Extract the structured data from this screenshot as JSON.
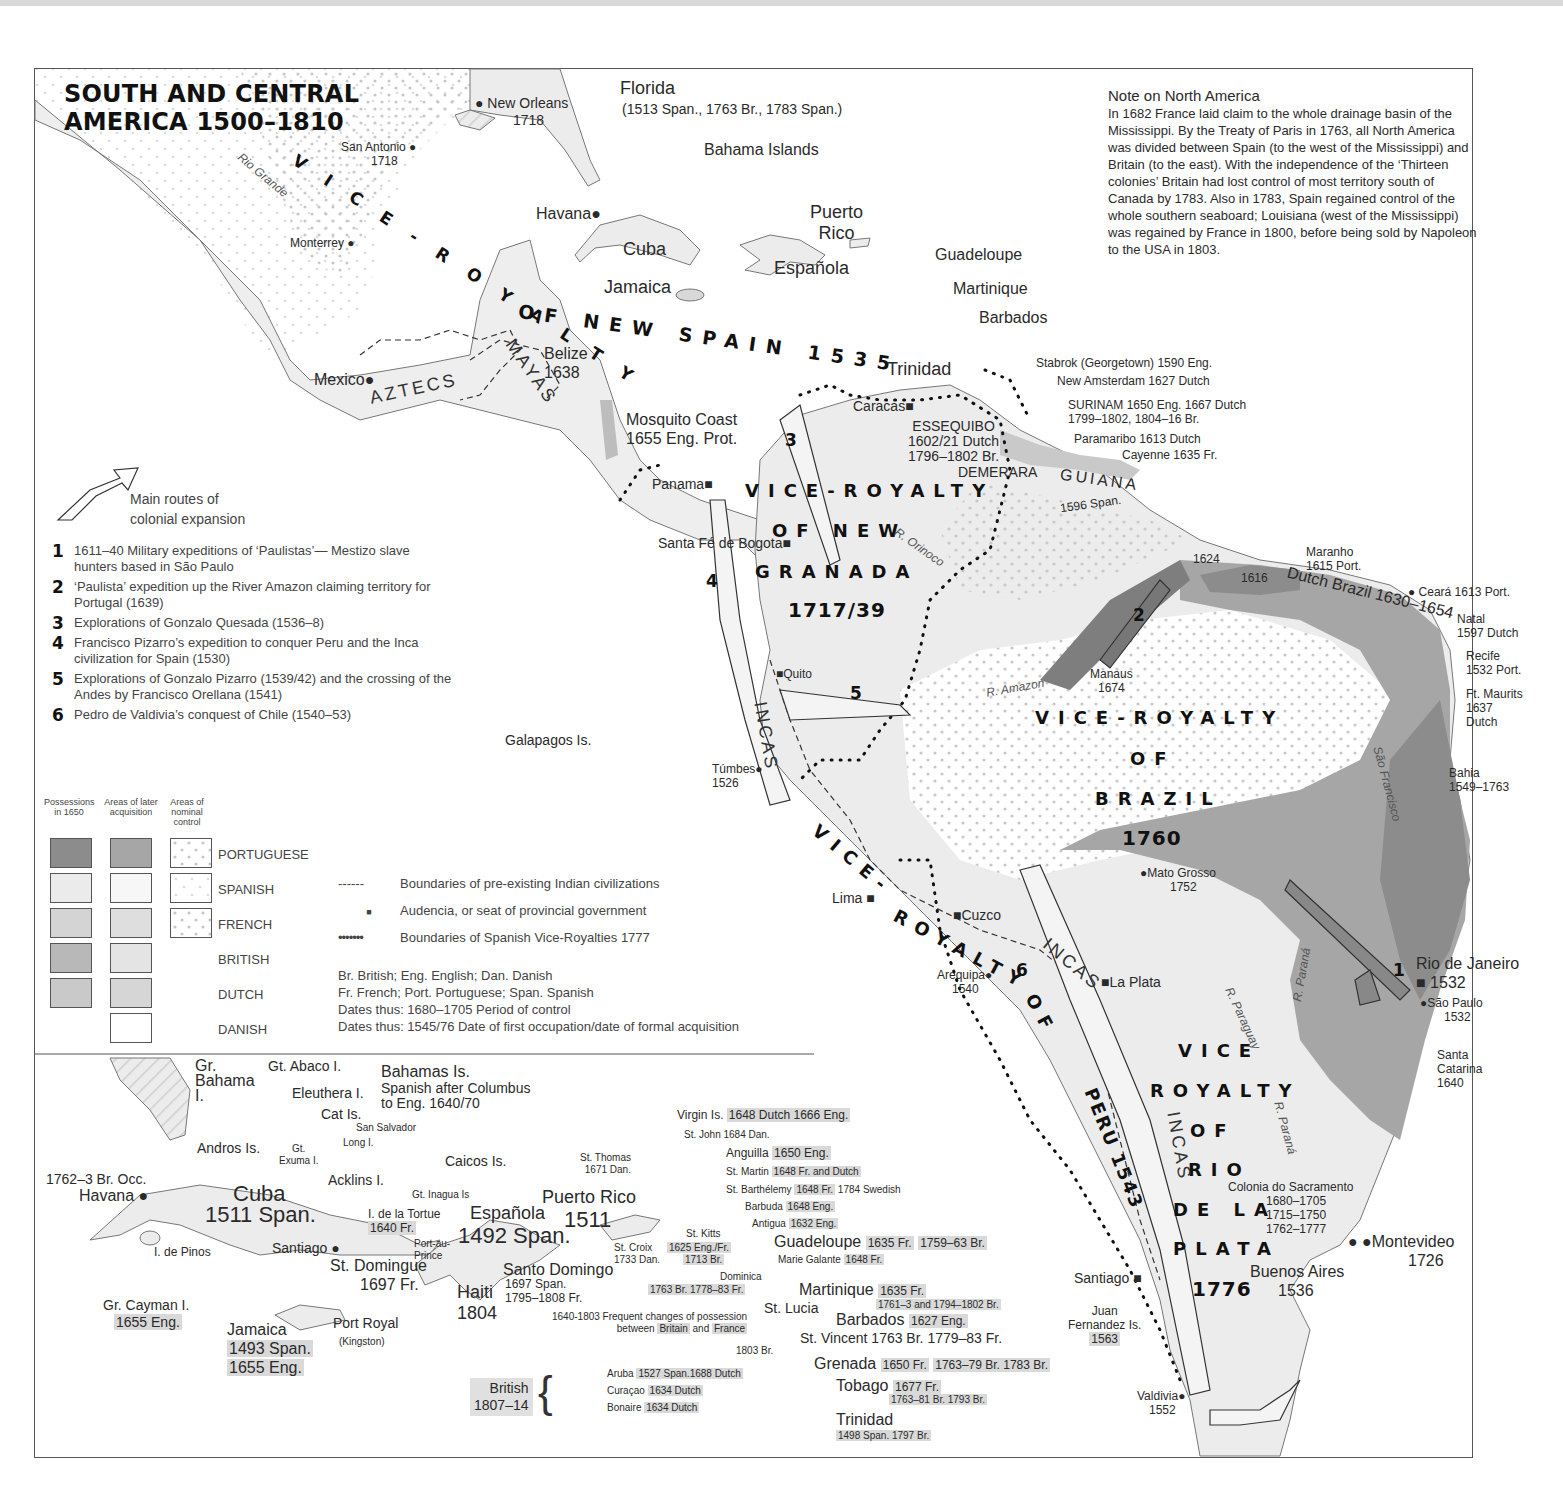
{
  "title": {
    "line1": "SOUTH AND CENTRAL",
    "line2": "AMERICA 1500–1810"
  },
  "colors": {
    "portuguese_1650": "#8c8c8c",
    "portuguese_later": "#a6a6a6",
    "spanish": "#ebebeb",
    "french": "#d4d4d4",
    "british": "#b8b8b8",
    "dutch": "#c9c9c9",
    "danish": "#ffffff",
    "sea": "#ffffff",
    "border": "#555555"
  },
  "note": {
    "heading": "Note on North America",
    "body": "In 1682 France laid claim to the whole drainage basin of the Mississippi.  By the Treaty of Paris in 1763, all North America was divided between Spain (to the west of the Mississippi) and Britain (to the east).  With the independence of the ‘Thirteen colonies’ Britain had lost control of most territory south of Canada by 1783.  Also in 1783, Spain regained control of the whole southern seaboard; Louisiana (west of the Mississippi) was regained by France in 1800, before being sold by Napoleon to the USA in 1803."
  },
  "viceroyalties": {
    "new_spain": "VICE-ROYALTY OF NEW SPAIN 1535",
    "new_granada": {
      "l1": "VICE-ROYALTY",
      "l2": "OF NEW",
      "l3": "GRANADA",
      "l4": "1717/39"
    },
    "brazil": {
      "l1": "VICE-ROYALTY",
      "l2": "OF",
      "l3": "BRAZIL",
      "l4": "1760"
    },
    "peru": {
      "l1": "VICE-",
      "l2": "ROYALTY",
      "l3": "OF",
      "l4": "PERU 1543"
    },
    "rio_de_la_plata": {
      "l1": "VICE",
      "l2": "ROYALTY",
      "l3": "OF",
      "l4": "RIO",
      "l5": "DE LA",
      "l6": "PLATA",
      "l7": "1776"
    }
  },
  "civilizations": {
    "aztecs": "AZTECS",
    "mayas": "MAYAS",
    "incas": "INCAS"
  },
  "rivers": {
    "rio_grande": "Rio Grande",
    "orinoco": "R. Orinoco",
    "amazon": "R. Amazon",
    "sao_francisco": "São Francisco",
    "parana1": "R. Paraná",
    "paraguay": "R. Paraguay",
    "parana2": "R. Paraná"
  },
  "places": {
    "new_orleans": {
      "name": "New Orleans",
      "date": "1718"
    },
    "florida": {
      "name": "Florida",
      "date": "(1513 Span., 1763 Br., 1783 Span.)"
    },
    "san_antonio": {
      "name": "San Antonio",
      "date": "1718"
    },
    "monterrey": "Monterrey",
    "bahama_islands": "Bahama Islands",
    "havana": "Havana",
    "cuba": "Cuba",
    "puerto_rico": {
      "l1": "Puerto",
      "l2": "Rico"
    },
    "guadeloupe": "Guadeloupe",
    "espanola": "Española",
    "martinique": "Martinique",
    "jamaica": "Jamaica",
    "barbados": "Barbados",
    "mexico": "Mexico",
    "belize": {
      "name": "Belize",
      "date": "1638"
    },
    "trinidad": "Trinidad",
    "mosquito_coast": {
      "name": "Mosquito Coast",
      "date": "1655 Eng. Prot."
    },
    "caracas": "Caracas",
    "essequibo": {
      "name": "ESSEQUIBO",
      "d1": "1602/21 Dutch",
      "d2": "1796–1802 Br."
    },
    "demerara": "DEMERARA",
    "stabrok": "Stabrok (Georgetown) 1590 Eng.",
    "new_amsterdam": "New Amsterdam 1627 Dutch",
    "surinam": {
      "l1": "SURINAM 1650 Eng. 1667 Dutch",
      "l2": "1799–1802, 1804–16 Br."
    },
    "paramaribo": "Paramaribo 1613 Dutch",
    "cayenne": "Cayenne 1635 Fr.",
    "guiana": {
      "name": "GUIANA",
      "date": "1596 Span."
    },
    "panama": "Panama",
    "bogota": "Santa Fé de Bogota",
    "maranho": {
      "name": "Maranho",
      "date": "1615 Port."
    },
    "ceara": "Ceará 1613 Port.",
    "dutch_brazil": "Dutch Brazil 1630–1654",
    "natal": {
      "name": "Natal",
      "date": "1597 Dutch"
    },
    "recife": {
      "name": "Recife",
      "date": "1532 Port."
    },
    "ft_maurits": {
      "name": "Ft. Maurits",
      "d1": "1637",
      "d2": "Dutch"
    },
    "bahia": {
      "name": "Bahia",
      "date": "1549–1763"
    },
    "y1624": "1624",
    "y1616": "1616",
    "manaus": {
      "name": "Manaus",
      "date": "1674"
    },
    "quito": "Quito",
    "galapagos": "Galapagos Is.",
    "tumbes": {
      "name": "Túmbes",
      "date": "1526"
    },
    "mato_grosso": {
      "name": "Mato Grosso",
      "date": "1752"
    },
    "lima": "Lima",
    "cuzco": "Cuzco",
    "arequipa": {
      "name": "Arequipa",
      "date": "1540"
    },
    "la_plata": "La Plata",
    "rio_de_janeiro": {
      "name": "Rio de Janeiro",
      "date": "1532"
    },
    "sao_paulo": {
      "name": "São Paulo",
      "date": "1532"
    },
    "santa_catarina": {
      "l1": "Santa",
      "l2": "Catarina",
      "l3": "1640"
    },
    "colonia": {
      "name": "Colonia do Sacramento",
      "d1": "1680–1705",
      "d2": "1715–1750",
      "d3": "1762–1777"
    },
    "montevideo": {
      "name": "Montevideo",
      "date": "1726"
    },
    "buenos_aires": {
      "name": "Buenos Aires",
      "date": "1536"
    },
    "santiago": "Santiago",
    "juan_fernandez": {
      "l1": "Juan",
      "l2": "Fernandez Is.",
      "l3": "1563"
    },
    "valdivia": {
      "name": "Valdivia",
      "date": "1552"
    }
  },
  "routes_legend": {
    "arrow_label_1": "Main routes of",
    "arrow_label_2": "colonial expansion",
    "items": [
      {
        "n": "1",
        "text": "1611–40 Military expeditions of ‘Paulistas’— Mestizo slave hunters based in São Paulo"
      },
      {
        "n": "2",
        "text": "‘Paulista’ expedition up the River Amazon claiming territory for Portugal (1639)"
      },
      {
        "n": "3",
        "text": "Explorations of Gonzalo Quesada (1536–8)"
      },
      {
        "n": "4",
        "text": "Francisco Pizarro’s expedition to conquer Peru and the Inca civilization for Spain (1530)"
      },
      {
        "n": "5",
        "text": "Explorations of Gonzalo Pizarro (1539/42) and the crossing of the Andes by Francisco Orellana (1541)"
      },
      {
        "n": "6",
        "text": "Pedro de Valdivia’s conquest of Chile (1540–53)"
      }
    ]
  },
  "legend": {
    "col1": "Possessions in 1650",
    "col2": "Areas of later acquisition",
    "col3": "Areas of nominal control",
    "nations": [
      "PORTUGUESE",
      "SPANISH",
      "FRENCH",
      "BRITISH",
      "DUTCH",
      "DANISH"
    ],
    "symbols": [
      {
        "glyph": "------",
        "text": "Boundaries of pre-existing Indian civilizations"
      },
      {
        "glyph": "■",
        "text": "Audencia, or seat of provincial government"
      },
      {
        "glyph": "•••••••",
        "text": "Boundaries of Spanish Vice-Royalties 1777"
      }
    ],
    "abbr": [
      "Br. British; Eng. English; Dan. Danish",
      "Fr. French; Port. Portuguese; Span. Spanish",
      "Dates thus: 1680–1705 Period of control",
      "Dates thus: 1545/76 Date of first occupation/date of formal acquisition"
    ]
  },
  "inset": {
    "gr_bahama": {
      "l1": "Gr.",
      "l2": "Bahama",
      "l3": "I."
    },
    "gt_abaco": "Gt. Abaco I.",
    "bahamas": {
      "name": "Bahamas Is.",
      "l1": "Spanish after Columbus",
      "l2": "to Eng. 1640/70"
    },
    "eleuthera": "Eleuthera I.",
    "cat": "Cat Is.",
    "san_salvador": "San Salvador",
    "andros": "Andros Is.",
    "gt_exuma": {
      "l1": "Gt.",
      "l2": "Exuma I."
    },
    "long": "Long I.",
    "caicos": "Caicos Is.",
    "acklins": "Acklins I.",
    "gt_inagua": "Gt. Inagua Is",
    "havana": {
      "occ": "1762–3 Br. Occ.",
      "name": "Havana"
    },
    "cuba": {
      "name": "Cuba",
      "date": "1511 Span."
    },
    "tortue": {
      "name": "I. de la Tortue",
      "date": "1640 Fr."
    },
    "espanola": {
      "name": "Española",
      "date": "1492 Span."
    },
    "puerto_rico": {
      "name": "Puerto Rico",
      "date": "1511"
    },
    "pinos": "I. de Pinos",
    "santiago": "Santiago",
    "port_au_prince": {
      "l1": "Port-au-",
      "l2": "Prince"
    },
    "st_domingue": {
      "name": "St. Domingue",
      "date": "1697 Fr."
    },
    "santo_domingo": {
      "name": "Santo Domingo",
      "d1": "1697 Span.",
      "d2": "1795–1808 Fr."
    },
    "haiti": {
      "name": "Haiti",
      "date": "1804"
    },
    "cayman": {
      "name": "Gr. Cayman I.",
      "date": "1655 Eng."
    },
    "jamaica": {
      "name": "Jamaica",
      "d1": "1493 Span.",
      "d2": "1655 Eng."
    },
    "port_royal": {
      "name": "Port Royal",
      "sub": "(Kingston)"
    },
    "virgin": {
      "name": "Virgin Is.",
      "date": "1648 Dutch 1666 Eng."
    },
    "st_john": "St. John 1684 Dan.",
    "st_thomas": {
      "name": "St. Thomas",
      "date": "1671 Dan."
    },
    "anguilla": {
      "name": "Anguilla",
      "date": "1650 Eng."
    },
    "st_martin": {
      "name": "St. Martin",
      "date": "1648 Fr. and Dutch"
    },
    "st_barth": {
      "name": "St. Barthélemy",
      "date": "1648 Fr.",
      "extra": "1784 Swedish"
    },
    "barbuda": {
      "name": "Barbuda",
      "date": "1648 Eng."
    },
    "antigua": {
      "name": "Antigua",
      "date": "1632 Eng."
    },
    "st_kitts": {
      "name": "St. Kitts",
      "d1": "1625 Eng./Fr.",
      "d2": "1713 Br."
    },
    "st_croix": {
      "name": "St. Croix",
      "date": "1733 Dan."
    },
    "guadeloupe": {
      "name": "Guadeloupe",
      "date": "1635 Fr.",
      "extra": "1759–63 Br."
    },
    "marie_galante": {
      "name": "Marie Galante",
      "date": "1648 Fr."
    },
    "dominica": {
      "name": "Dominica",
      "date": "1763 Br. 1778–83 Fr."
    },
    "martinique": {
      "name": "Martinique",
      "date": "1635 Fr.",
      "extra": "1761–3 and 1794–1802 Br."
    },
    "st_lucia": "St. Lucia",
    "frequent": {
      "l1": "1640-1803 Frequent changes of possession",
      "l2a": "between ",
      "l2b": "Britain",
      "l2c": " and ",
      "l2d": "France",
      "l3": "1803 Br."
    },
    "barbados": {
      "name": "Barbados",
      "date": "1627 Eng."
    },
    "st_vincent": "St. Vincent 1763 Br. 1779–83 Fr.",
    "grenada": {
      "name": "Grenada",
      "date": "1650 Fr.",
      "extra": "1763–79 Br. 1783 Br."
    },
    "tobago": {
      "name": "Tobago",
      "d1": "1677 Fr.",
      "d2": "1763–81 Br. 1793 Br."
    },
    "trinidad": {
      "name": "Trinidad",
      "date": "1498 Span. 1797 Br."
    },
    "british": {
      "l1": "British",
      "l2": "1807–14"
    },
    "aruba": {
      "name": "Aruba",
      "date": "1527 Span.1688 Dutch"
    },
    "curacao": {
      "name": "Curaçao",
      "date": "1634 Dutch"
    },
    "bonaire": {
      "name": "Bonaire",
      "date": "1634 Dutch"
    }
  },
  "route_numbers": [
    "1",
    "2",
    "3",
    "4",
    "5",
    "6"
  ]
}
